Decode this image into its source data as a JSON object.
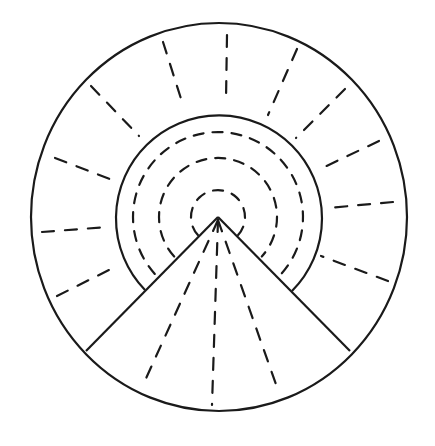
{
  "diagram": {
    "colors": {
      "stroke": "#1a1a1a",
      "background": "#ffffff"
    },
    "outer_circle": {
      "cx": 219,
      "cy": 217,
      "rx": 188,
      "ry": 194
    },
    "inner_circle": {
      "cx": 219,
      "cy": 213,
      "r": 103
    },
    "vertex": {
      "x": 218,
      "y": 217
    },
    "wedge_lines": [
      {
        "from": [
          218,
          217
        ],
        "to": [
          86,
          351
        ]
      },
      {
        "from": [
          218,
          217
        ],
        "to": [
          350,
          351
        ]
      }
    ],
    "inner_arc_ends": {
      "left": [
        145,
        290
      ],
      "right": [
        292,
        291
      ]
    },
    "dashed_arcs_radii": [
      27,
      59,
      85
    ],
    "outer_ring_rays": [
      {
        "x1": 227,
        "y1": 35,
        "x2": 226,
        "y2": 100
      },
      {
        "x1": 163,
        "y1": 42,
        "x2": 183,
        "y2": 105
      },
      {
        "x1": 91,
        "y1": 86,
        "x2": 139,
        "y2": 136
      },
      {
        "x1": 55,
        "y1": 158,
        "x2": 115,
        "y2": 181
      },
      {
        "x1": 42,
        "y1": 232,
        "x2": 107,
        "y2": 227
      },
      {
        "x1": 57,
        "y1": 296,
        "x2": 115,
        "y2": 267
      },
      {
        "x1": 297,
        "y1": 49,
        "x2": 268,
        "y2": 115
      },
      {
        "x1": 345,
        "y1": 89,
        "x2": 296,
        "y2": 138
      },
      {
        "x1": 379,
        "y1": 141,
        "x2": 318,
        "y2": 170
      },
      {
        "x1": 393,
        "y1": 202,
        "x2": 328,
        "y2": 208
      },
      {
        "x1": 388,
        "y1": 281,
        "x2": 321,
        "y2": 256
      }
    ],
    "wedge_rays": [
      {
        "x1": 218,
        "y1": 220,
        "x2": 143,
        "y2": 385
      },
      {
        "x1": 218,
        "y1": 220,
        "x2": 212,
        "y2": 405
      },
      {
        "x1": 218,
        "y1": 220,
        "x2": 278,
        "y2": 390
      }
    ]
  }
}
